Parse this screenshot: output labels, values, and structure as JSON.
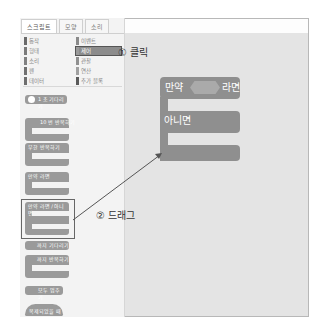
{
  "tabs": [
    {
      "label": "스크립트",
      "active": true
    },
    {
      "label": "모양",
      "active": false
    },
    {
      "label": "소리",
      "active": false
    }
  ],
  "categories": {
    "left": [
      {
        "label": "동작",
        "color": "#6a6a6a"
      },
      {
        "label": "형태",
        "color": "#7a7a7a"
      },
      {
        "label": "소리",
        "color": "#808080"
      },
      {
        "label": "펜",
        "color": "#707070"
      },
      {
        "label": "데이터",
        "color": "#6e6e6e"
      }
    ],
    "right": [
      {
        "label": "이벤트",
        "color": "#8a8a8a"
      },
      {
        "label": "제어",
        "color": "#9a9a9a",
        "selected": true
      },
      {
        "label": "관찰",
        "color": "#909090"
      },
      {
        "label": "연산",
        "color": "#a0a0a0"
      },
      {
        "label": "추가 블록",
        "color": "#5a5a5a"
      }
    ]
  },
  "palette_blocks": [
    {
      "label": "1 초 기다리기"
    },
    {
      "label": "10 번 반복하기"
    },
    {
      "label": "무한 반복하기"
    },
    {
      "label": "만약 라면"
    },
    {
      "label": "만약 라면 / 아니면"
    },
    {
      "label": "까지 기다리기"
    },
    {
      "label": "까지 반복하기"
    },
    {
      "label": "모두 멈추기"
    },
    {
      "label": "복제되었을 때"
    }
  ],
  "canvas_block": {
    "if_label": "만약",
    "then_label": "라면",
    "else_label": "아니면"
  },
  "annotations": {
    "step1": "① 클릭",
    "step2": "② 드래그"
  }
}
